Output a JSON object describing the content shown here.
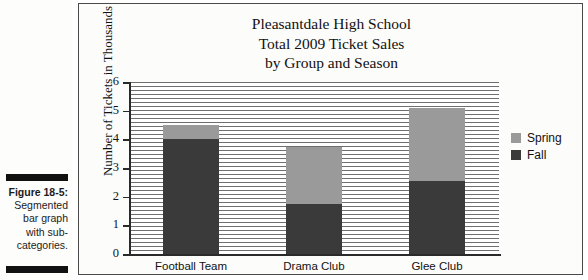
{
  "caption": {
    "figure_number": "Figure 18-5:",
    "lines": [
      "Segmented",
      "bar graph",
      "with sub-",
      "categories."
    ]
  },
  "chart_data": {
    "type": "bar",
    "subtype": "stacked",
    "title": "Pleasantdale High School Total 2009 Ticket Sales by Group and Season",
    "title_lines": [
      "Pleasantdale High School",
      "Total 2009 Ticket Sales",
      "by Group and Season"
    ],
    "xlabel": "",
    "ylabel": "Number of Tickets in Thousands",
    "ylim": [
      0,
      6
    ],
    "ytick_labels": [
      "0",
      "1",
      "2",
      "3",
      "4",
      "5",
      "6"
    ],
    "yticks": [
      0,
      1,
      2,
      3,
      4,
      5,
      6
    ],
    "grid": true,
    "legend_position": "right",
    "categories": [
      "Football Team",
      "Drama Club",
      "Glee Club"
    ],
    "series": [
      {
        "name": "Spring",
        "color": "#9a9a9a",
        "values": [
          0.5,
          2.0,
          2.55
        ]
      },
      {
        "name": "Fall",
        "color": "#3a3a3a",
        "values": [
          4.0,
          1.75,
          2.55
        ]
      }
    ],
    "totals": [
      4.5,
      3.75,
      5.1
    ]
  }
}
